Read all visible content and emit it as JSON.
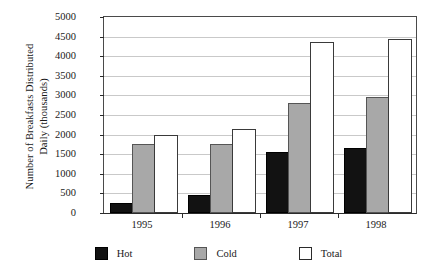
{
  "chart_data": {
    "type": "bar",
    "title": "",
    "subtitle": "",
    "xlabel": "",
    "ylabel": "Number of Breakfasts Distributed\nDaily (thousands)",
    "categories": [
      "1995",
      "1996",
      "1997",
      "1998"
    ],
    "series": [
      {
        "name": "Hot",
        "values": [
          200,
          400,
          1500,
          1600
        ],
        "color": "#121212"
      },
      {
        "name": "Cold",
        "values": [
          1700,
          1700,
          2750,
          2900
        ],
        "color": "#a8a8a8"
      },
      {
        "name": "Total",
        "values": [
          1950,
          2100,
          4300,
          4400
        ],
        "color": "#ffffff"
      }
    ],
    "ylim": [
      0,
      5000
    ],
    "ytick_labels": [
      "5000",
      "4500",
      "4000",
      "3500",
      "3000",
      "2500",
      "2000",
      "1500",
      "1000",
      "500",
      "0"
    ],
    "ytick_values": [
      5000,
      4500,
      4000,
      3500,
      3000,
      2500,
      2000,
      1500,
      1000,
      500,
      0
    ],
    "grid": true,
    "grid_axis": "y",
    "legend_position": "bottom",
    "legend_entries": [
      "Hot",
      "Cold",
      "Total"
    ]
  }
}
